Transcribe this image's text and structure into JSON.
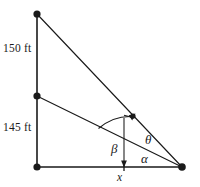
{
  "figure": {
    "background_color": "#ffffff",
    "stroke_color": "#1a1a1a",
    "labels": {
      "upper_segment": "150 ft",
      "lower_segment": "145 ft",
      "angle_theta": "θ",
      "angle_alpha": "α",
      "angle_beta": "β",
      "base_variable": "x"
    },
    "icons": {
      "vertex_top": "vertex-dot",
      "vertex_middle": "vertex-dot",
      "vertex_bottom_left": "vertex-dot",
      "vertex_bottom_right": "vertex-dot",
      "marker_on_upper_ray": "point-marker",
      "beta_arrow_down": "arrowhead-down",
      "beta_arrow_upper": "arrowhead-up-right"
    },
    "geometry": {
      "vertical_line": {
        "x": 37,
        "y_top": 14,
        "y_bottom": 167
      },
      "baseline": {
        "y": 167,
        "x_left": 37,
        "x_right": 182
      },
      "vertex_top": {
        "x": 37,
        "y": 14
      },
      "vertex_middle": {
        "x": 37,
        "y": 96
      },
      "vertex_bottom_left": {
        "x": 37,
        "y": 167
      },
      "vertex_bottom_right": {
        "x": 182,
        "y": 167
      },
      "ray_top_to_right": {
        "x1": 37,
        "y1": 14,
        "x2": 182,
        "y2": 167
      },
      "ray_middle_to_right": {
        "x1": 37,
        "y1": 96,
        "x2": 182,
        "y2": 167
      },
      "x_tick": {
        "x": 124,
        "y": 167
      },
      "marker_point": {
        "x": 133,
        "y": 116
      },
      "beta_arc": {
        "cx": 124,
        "cy": 167,
        "r": 52
      }
    }
  }
}
